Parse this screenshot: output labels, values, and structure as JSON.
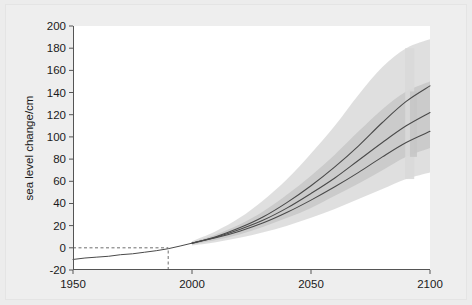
{
  "chart_data": {
    "type": "line",
    "title": "",
    "xlabel": "",
    "ylabel": "sea level change/cm",
    "xlim": [
      1950,
      2100
    ],
    "ylim": [
      -20,
      200
    ],
    "xticks": [
      1950,
      2000,
      2050,
      2100
    ],
    "xtick_labels": [
      "1950",
      "2000",
      "2050",
      "2100"
    ],
    "yticks": [
      -20,
      0,
      20,
      40,
      60,
      80,
      100,
      120,
      140,
      160,
      180,
      200
    ],
    "ytick_labels": [
      "-20",
      "0",
      "20",
      "40",
      "60",
      "80",
      "100",
      "120",
      "140",
      "160",
      "180",
      "200"
    ],
    "grid": false,
    "legend": "none",
    "reference_lines": [
      {
        "name": "zero-baseline",
        "orientation": "horizontal",
        "value": 0,
        "style": "dashed",
        "x_from": 1950,
        "x_to": 1990
      },
      {
        "name": "baseline-year",
        "orientation": "vertical",
        "value": 1990,
        "style": "dashed",
        "y_from": -20,
        "y_to": 0
      }
    ],
    "series": [
      {
        "name": "observed",
        "kind": "historical",
        "x": [
          1950,
          1955,
          1960,
          1965,
          1970,
          1975,
          1980,
          1985,
          1990,
          1995,
          2000
        ],
        "values": [
          -10.5,
          -9.2,
          -8.4,
          -7.6,
          -6.2,
          -5.4,
          -4.0,
          -2.6,
          -0.8,
          1.6,
          4.2
        ]
      },
      {
        "name": "projection-high",
        "kind": "projection",
        "x": [
          2000,
          2010,
          2020,
          2030,
          2040,
          2050,
          2060,
          2070,
          2080,
          2090,
          2100
        ],
        "values": [
          4.2,
          10,
          18,
          28,
          41,
          56,
          73,
          92,
          113,
          132,
          146
        ]
      },
      {
        "name": "projection-mid",
        "kind": "projection",
        "x": [
          2000,
          2010,
          2020,
          2030,
          2040,
          2050,
          2060,
          2070,
          2080,
          2090,
          2100
        ],
        "values": [
          4.2,
          9.5,
          16.5,
          25,
          36,
          49,
          63,
          79,
          95,
          110,
          122
        ]
      },
      {
        "name": "projection-low",
        "kind": "projection",
        "x": [
          2000,
          2010,
          2020,
          2030,
          2040,
          2050,
          2060,
          2070,
          2080,
          2090,
          2100
        ],
        "values": [
          4.2,
          9,
          15,
          22.5,
          32,
          43,
          55,
          68,
          82,
          95,
          105
        ]
      }
    ],
    "bands": [
      {
        "name": "outer-uncertainty-band",
        "x": [
          2000,
          2010,
          2020,
          2030,
          2040,
          2050,
          2060,
          2070,
          2080,
          2090,
          2100
        ],
        "upper": [
          6,
          15,
          27,
          43,
          62,
          85,
          110,
          138,
          163,
          180,
          188
        ],
        "lower": [
          2,
          5,
          9,
          14,
          20,
          27,
          35,
          44,
          53,
          62,
          68
        ]
      },
      {
        "name": "inner-uncertainty-band",
        "x": [
          2000,
          2010,
          2020,
          2030,
          2040,
          2050,
          2060,
          2070,
          2080,
          2090,
          2100
        ],
        "upper": [
          5,
          12,
          21,
          33,
          48,
          65,
          84,
          105,
          125,
          141,
          150
        ],
        "lower": [
          3,
          7,
          12,
          19,
          27,
          36,
          47,
          58,
          70,
          82,
          90
        ]
      }
    ],
    "band_terminators": [
      {
        "name": "terminator-outer",
        "x": 2090,
        "y_low": 62,
        "y_high": 180
      },
      {
        "name": "terminator-inner",
        "x": 2092,
        "y_low": 82,
        "y_high": 141
      }
    ],
    "colors": {
      "background": "#ececec",
      "plot_area": "#ffffff",
      "axis": "#555555",
      "line": "#4a4a4a",
      "band_outer": "#d9d9d9",
      "band_inner": "#c6c6c6",
      "tick_text": "#1a1a1a"
    }
  }
}
